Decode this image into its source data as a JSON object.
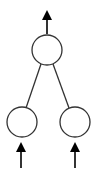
{
  "diagram": {
    "type": "tree",
    "stroke_color": "#333333",
    "fill_color": "#ffffff",
    "arrow_color": "#000000",
    "nodes": [
      {
        "id": "root",
        "cx": 47,
        "cy": 50,
        "r": 15
      },
      {
        "id": "left-child",
        "cx": 22,
        "cy": 122,
        "r": 15
      },
      {
        "id": "right-child",
        "cx": 75,
        "cy": 122,
        "r": 15
      }
    ],
    "edges": [
      {
        "from": "root",
        "to": "left-child",
        "x1": 41,
        "y1": 64,
        "x2": 26,
        "y2": 108
      },
      {
        "from": "root",
        "to": "right-child",
        "x1": 53,
        "y1": 64,
        "x2": 69,
        "y2": 108
      }
    ],
    "arrows": [
      {
        "id": "output-arrow",
        "direction": "up",
        "x": 47,
        "tip_y": 10,
        "base_y": 34
      },
      {
        "id": "left-input-arrow",
        "direction": "up",
        "x": 21,
        "tip_y": 142,
        "base_y": 168
      },
      {
        "id": "right-input-arrow",
        "direction": "up",
        "x": 75,
        "tip_y": 142,
        "base_y": 168
      }
    ]
  }
}
